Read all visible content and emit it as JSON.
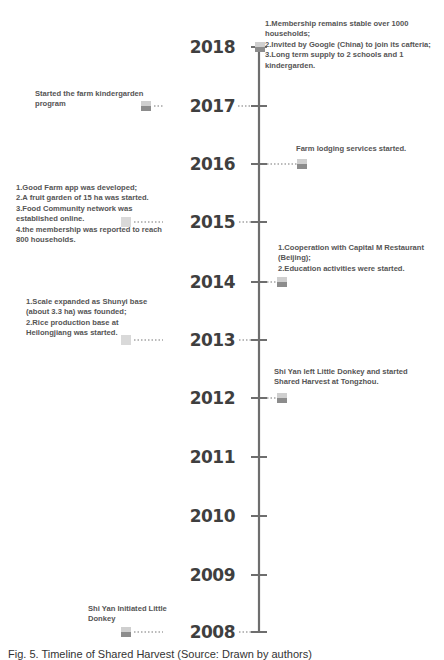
{
  "accent_colors": {
    "axis": "#6e6e6e",
    "marker_dark": "#8c8c8c",
    "marker_light": "#d9d9d9",
    "text": "#555555"
  },
  "events": [
    {
      "year": "2018",
      "side": "right",
      "note": "1.Membership remains stable over 1000\nhouseholds;\n2.Invited by Google (China) to join its cafteria;\n3.Long term supply to 2 schools and 1\nkindergarden."
    },
    {
      "year": "2017",
      "side": "left",
      "note": "Started the farm kindergarden\nprogram"
    },
    {
      "year": "2016",
      "side": "right",
      "note": "Farm lodging services started."
    },
    {
      "year": "2015",
      "side": "left",
      "note": "1.Good Farm app was developed;\n2.A fruit garden of 15 ha was started.\n3.Food Community network was\nestablished online.\n4.the membership was reported to reach\n800 households."
    },
    {
      "year": "2014",
      "side": "right",
      "note": "1.Cooperation with Capital M Restaurant\n(Beijing);\n2.Education activities were started."
    },
    {
      "year": "2013",
      "side": "left",
      "note": "1.Scale expanded as Shunyi base\n(about 3.3 ha) was founded;\n2.Rice production base at\nHeilongjiang was started."
    },
    {
      "year": "2012",
      "side": "right",
      "note": "Shi Yan left Little Donkey and started\nShared Harvest at Tongzhou."
    },
    {
      "year": "2011",
      "side": "none",
      "note": ""
    },
    {
      "year": "2010",
      "side": "none",
      "note": ""
    },
    {
      "year": "2009",
      "side": "none",
      "note": ""
    },
    {
      "year": "2008",
      "side": "left",
      "note": "Shi Yan Initiated Little\nDonkey"
    }
  ],
  "caption": "Fig. 5.  Timeline of Shared Harvest (Source: Drawn by authors)"
}
